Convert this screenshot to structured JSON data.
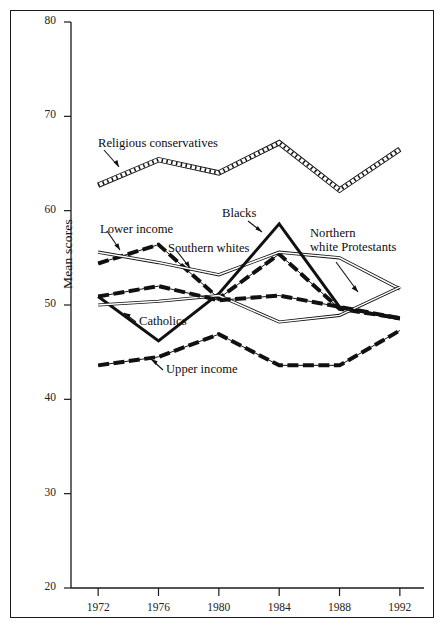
{
  "figure": {
    "border": true,
    "background": "#ffffff",
    "ink": "#111111"
  },
  "axes": {
    "ylabel": "Mean scores",
    "yticks": [
      "80",
      "70",
      "60",
      "50",
      "40",
      "30",
      "20"
    ],
    "xticks": [
      "1972",
      "1976",
      "1980",
      "1984",
      "1988",
      "1992"
    ]
  },
  "annotations": [
    {
      "name": "religious-conservatives",
      "text": "Religious conservatives"
    },
    {
      "name": "lower-income",
      "text": "Lower income"
    },
    {
      "name": "southern-whites",
      "text": "Southern whites"
    },
    {
      "name": "blacks",
      "text": "Blacks"
    },
    {
      "name": "northern-white-protestants-line1",
      "text": "Northern"
    },
    {
      "name": "northern-white-protestants-line2",
      "text": "white Protestants"
    },
    {
      "name": "catholics",
      "text": "Catholics"
    },
    {
      "name": "upper-income",
      "text": "Upper income"
    }
  ],
  "chart_data": {
    "type": "line",
    "title": "",
    "xlabel": "",
    "ylabel": "Mean scores",
    "x": [
      1972,
      1976,
      1980,
      1984,
      1988,
      1992
    ],
    "xlim": [
      1970.2,
      1993.6
    ],
    "ylim": [
      20,
      80
    ],
    "yticks": [
      20,
      30,
      40,
      50,
      60,
      70,
      80
    ],
    "grid": false,
    "legend": "inline-annotations",
    "series": [
      {
        "name": "Religious conservatives",
        "style": "hatched-ladder",
        "values": [
          62.7,
          65.4,
          64.0,
          67.2,
          62.2,
          66.5
        ]
      },
      {
        "name": "Lower income",
        "style": "thick-dashed",
        "values": [
          54.4,
          56.4,
          50.7,
          55.4,
          49.6,
          48.6
        ]
      },
      {
        "name": "Southern whites",
        "style": "double-thin-line",
        "values": [
          55.6,
          54.5,
          53.2,
          55.6,
          55.0,
          51.7
        ]
      },
      {
        "name": "Blacks",
        "style": "solid-thick",
        "values": [
          50.9,
          46.2,
          51.2,
          58.6,
          49.8,
          48.5
        ]
      },
      {
        "name": "Northern white Protestants",
        "style": "double-thin-line",
        "values": [
          50.0,
          50.4,
          51.0,
          48.2,
          48.9,
          51.9
        ]
      },
      {
        "name": "Catholics",
        "style": "thick-dashed",
        "values": [
          50.9,
          52.0,
          50.5,
          51.0,
          49.8,
          48.6
        ]
      },
      {
        "name": "Upper income",
        "style": "thick-dashed",
        "values": [
          43.6,
          44.5,
          46.9,
          43.6,
          43.6,
          47.3
        ]
      }
    ]
  }
}
